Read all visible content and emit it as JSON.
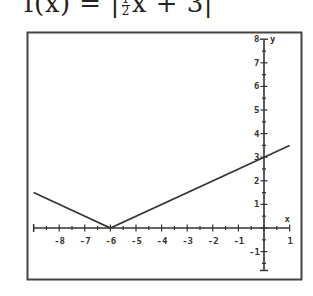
{
  "title": {
    "prefix": "f(x) = |",
    "frac_num": "1",
    "frac_den": "2",
    "suffix": "x + 3|"
  },
  "chart_data": {
    "type": "line",
    "xlabel": "x",
    "ylabel": "y",
    "xlim": [
      -9,
      1
    ],
    "ylim": [
      -1.8,
      8
    ],
    "grid": false,
    "x_ticks": [
      -8,
      -7,
      -6,
      -5,
      -4,
      -3,
      -2,
      -1,
      1
    ],
    "y_ticks": [
      -1,
      1,
      2,
      3,
      4,
      5,
      6,
      7,
      8
    ],
    "series": [
      {
        "name": "f(x) = |1/2 x + 3|",
        "x": [
          -9,
          -6,
          1
        ],
        "y": [
          1.5,
          0,
          3.5
        ]
      }
    ],
    "annotations": [
      "vertex at (-6, 0)",
      "y-intercept at (0, 3)"
    ]
  },
  "axes": {
    "x_label": "x",
    "y_label": "y",
    "x_tick_labels": [
      "-8",
      "-7",
      "-6",
      "-5",
      "-4",
      "-3",
      "-2",
      "-1",
      "1"
    ],
    "y_tick_labels": [
      "8",
      "7",
      "6",
      "5",
      "4",
      "3",
      "2",
      "1",
      "-1"
    ],
    "line_color": "#333333",
    "frame_color": "#444444"
  }
}
